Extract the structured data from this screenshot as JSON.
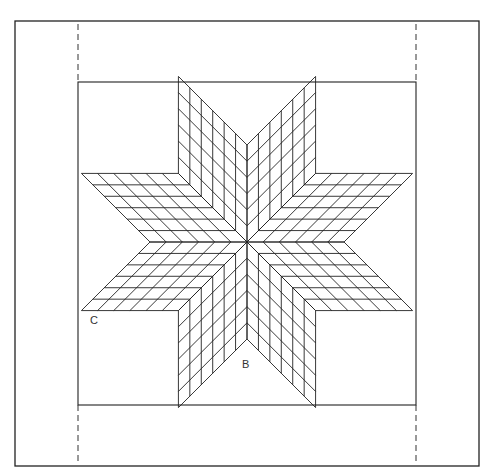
{
  "diagram": {
    "labels": {
      "c": "C",
      "b": "B"
    },
    "star": {
      "points": 8,
      "grid_divisions": 6
    },
    "colors": {
      "line": "#222222",
      "background": "#ffffff"
    }
  }
}
